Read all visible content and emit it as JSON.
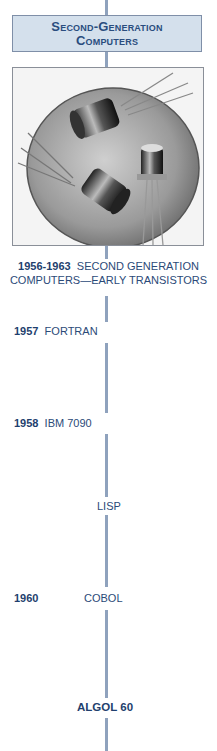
{
  "header": {
    "title_line1": "Second-Generation",
    "title_line2": "Computers"
  },
  "photo": {
    "description": "Early transistors resting on a coin",
    "icon": "transistors-photo"
  },
  "caption": {
    "year": "1956-1963",
    "text_line1": "SECOND GENERATION",
    "text_line2": "COMPUTERS—EARLY TRANSISTORS"
  },
  "timeline": [
    {
      "year": "1957",
      "label": "FORTRAN"
    },
    {
      "year": "1958",
      "label": "IBM 7090"
    },
    {
      "year": "",
      "label": "LISP"
    },
    {
      "year": "1960",
      "label": "COBOL"
    },
    {
      "year": "",
      "label": "ALGOL 60"
    }
  ],
  "colors": {
    "accent_text": "#1f3f6e",
    "line": "#8fa2bd",
    "header_bg": "#d4e0ec"
  }
}
